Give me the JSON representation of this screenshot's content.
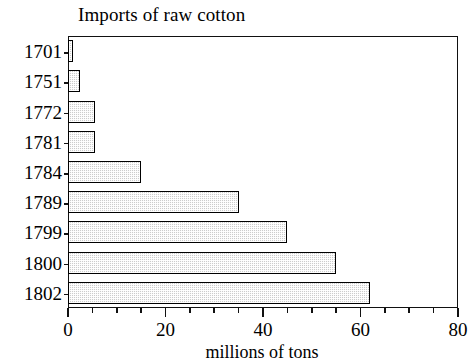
{
  "chart_data": {
    "type": "bar",
    "orientation": "horizontal",
    "title": "Imports of raw cotton",
    "xlabel": "millions of tons",
    "ylabel": "",
    "categories": [
      "1701",
      "1751",
      "1772",
      "1781",
      "1784",
      "1789",
      "1799",
      "1800",
      "1802"
    ],
    "values": [
      1,
      2.5,
      5.5,
      5.5,
      15,
      35,
      45,
      55,
      62
    ],
    "xlim": [
      0,
      80
    ],
    "xticks": [
      0,
      20,
      40,
      60,
      80
    ],
    "xtick_labels": [
      "0",
      "20",
      "40",
      "60",
      "80"
    ],
    "minor_tick_step": 5,
    "grid": false,
    "legend": null,
    "bar_fill_color": "#cccccc",
    "bar_edge_color": "#000000",
    "frame_color": "#111111",
    "background_color": "#ffffff"
  }
}
